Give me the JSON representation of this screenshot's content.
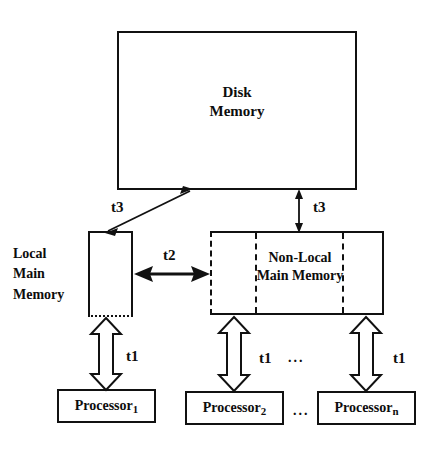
{
  "diagram": {
    "nodes": {
      "disk_memory": {
        "line1": "Disk",
        "line2": "Memory"
      },
      "local_main_memory": {
        "line1": "Local",
        "line2": "Main",
        "line3": "Memory"
      },
      "non_local_main_memory": {
        "line1": "Non-Local",
        "line2": "Main Memory"
      }
    },
    "processors": [
      {
        "name": "Processor",
        "index": "1"
      },
      {
        "name": "Processor",
        "index": "2"
      },
      {
        "name": "Processor",
        "index": "n"
      }
    ],
    "processor_ellipsis": "...",
    "latency_labels": {
      "t1_left": "t1",
      "t1_middle": "t1",
      "t1_right": "t1",
      "t2": "t2",
      "t3_left": "t3",
      "t3_right": "t3"
    },
    "memory_ellipsis": "...",
    "colors": {
      "line": "#111111",
      "text": "#0d0d0d",
      "background": "#ffffff"
    }
  }
}
